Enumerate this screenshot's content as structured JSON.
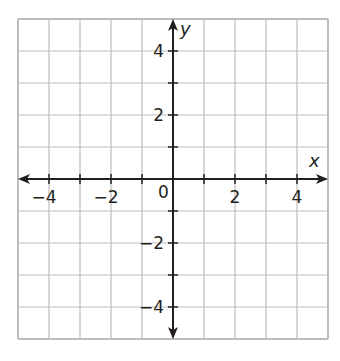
{
  "graph": {
    "x_axis_label": "x",
    "y_axis_label": "y",
    "origin_label": "0",
    "x_range": [
      -5,
      5
    ],
    "y_range": [
      -5,
      5
    ],
    "grid_step": 1,
    "x_tick_labels": [
      {
        "value": -4,
        "text": "−4"
      },
      {
        "value": -2,
        "text": "−2"
      },
      {
        "value": 2,
        "text": "2"
      },
      {
        "value": 4,
        "text": "4"
      }
    ],
    "y_tick_labels": [
      {
        "value": 4,
        "text": "4"
      },
      {
        "value": 2,
        "text": "2"
      },
      {
        "value": -2,
        "text": "−2"
      },
      {
        "value": -4,
        "text": "−4"
      }
    ],
    "colors": {
      "grid": "#bdbdbd",
      "axis": "#231f20",
      "background": "#ffffff"
    }
  },
  "chart_data": {
    "type": "scatter",
    "title": "",
    "xlabel": "x",
    "ylabel": "y",
    "xlim": [
      -5,
      5
    ],
    "ylim": [
      -5,
      5
    ],
    "grid": true,
    "x_ticks": [
      -4,
      -2,
      2,
      4
    ],
    "y_ticks": [
      -4,
      -2,
      2,
      4
    ],
    "series": [],
    "annotations": [
      "0 at origin"
    ]
  }
}
